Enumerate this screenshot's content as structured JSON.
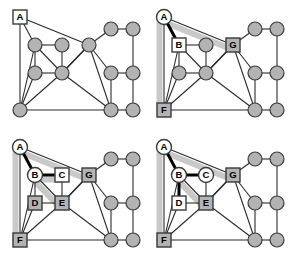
{
  "figure": {
    "panel_count": 4,
    "background_color": "#ffffff",
    "colors": {
      "node_fill_gray": "#b3b3b3",
      "node_fill_white": "#ffffff",
      "node_stroke": "#3a3a3a",
      "edge": "#2b2b2b",
      "edge_highlight_thick": "#000000",
      "path_halo": "#c9c9c9",
      "label_text": "#000000"
    },
    "geometry": {
      "view_width": 144,
      "view_height": 129,
      "node_radius": 7,
      "square_size": 14
    }
  },
  "graph": {
    "description": "Undirected graph with 13 vertices drawn in all four panels",
    "nodes": [
      {
        "id": "A",
        "x": 20,
        "y": 17
      },
      {
        "id": "B",
        "x": 35,
        "y": 45
      },
      {
        "id": "C",
        "x": 62,
        "y": 45
      },
      {
        "id": "G",
        "x": 89,
        "y": 45
      },
      {
        "id": "D",
        "x": 35,
        "y": 73
      },
      {
        "id": "E",
        "x": 62,
        "y": 73
      },
      {
        "id": "F",
        "x": 20,
        "y": 110
      },
      {
        "id": "H",
        "x": 111,
        "y": 29
      },
      {
        "id": "I",
        "x": 133,
        "y": 29
      },
      {
        "id": "J",
        "x": 111,
        "y": 73
      },
      {
        "id": "K",
        "x": 133,
        "y": 73
      },
      {
        "id": "L",
        "x": 111,
        "y": 110
      },
      {
        "id": "M",
        "x": 133,
        "y": 110
      }
    ],
    "edges": [
      [
        "A",
        "B"
      ],
      [
        "A",
        "F"
      ],
      [
        "A",
        "G"
      ],
      [
        "B",
        "C"
      ],
      [
        "B",
        "D"
      ],
      [
        "B",
        "E"
      ],
      [
        "B",
        "F"
      ],
      [
        "C",
        "E"
      ],
      [
        "D",
        "E"
      ],
      [
        "D",
        "F"
      ],
      [
        "E",
        "F"
      ],
      [
        "E",
        "G"
      ],
      [
        "E",
        "L"
      ],
      [
        "G",
        "H"
      ],
      [
        "G",
        "J"
      ],
      [
        "G",
        "L"
      ],
      [
        "G",
        "E"
      ],
      [
        "H",
        "I"
      ],
      [
        "I",
        "K"
      ],
      [
        "J",
        "K"
      ],
      [
        "J",
        "L"
      ],
      [
        "F",
        "L"
      ],
      [
        "L",
        "M"
      ],
      [
        "K",
        "M"
      ]
    ]
  },
  "panels": [
    {
      "index": 0,
      "name": "panel-initial-graph",
      "caption": "",
      "labeled_nodes": [
        {
          "id": "A",
          "label": "A",
          "shape": "square",
          "fill": "white"
        }
      ],
      "highlight_paths": [],
      "thick_edges": []
    },
    {
      "index": 1,
      "name": "panel-step-1",
      "caption": "",
      "labeled_nodes": [
        {
          "id": "A",
          "label": "A",
          "shape": "circle",
          "fill": "white"
        },
        {
          "id": "B",
          "label": "B",
          "shape": "square",
          "fill": "white"
        },
        {
          "id": "G",
          "label": "G",
          "shape": "square",
          "fill": "gray"
        },
        {
          "id": "F",
          "label": "F",
          "shape": "square",
          "fill": "gray"
        }
      ],
      "highlight_paths": [
        [
          "A",
          "G"
        ],
        [
          "A",
          "F"
        ]
      ],
      "thick_edges": [
        [
          "A",
          "B"
        ]
      ]
    },
    {
      "index": 2,
      "name": "panel-step-2",
      "caption": "",
      "labeled_nodes": [
        {
          "id": "A",
          "label": "A",
          "shape": "circle",
          "fill": "white"
        },
        {
          "id": "B",
          "label": "B",
          "shape": "circle",
          "fill": "white"
        },
        {
          "id": "C",
          "label": "C",
          "shape": "square",
          "fill": "white"
        },
        {
          "id": "G",
          "label": "G",
          "shape": "square",
          "fill": "gray"
        },
        {
          "id": "D",
          "label": "D",
          "shape": "square",
          "fill": "gray"
        },
        {
          "id": "E",
          "label": "E",
          "shape": "square",
          "fill": "gray"
        },
        {
          "id": "F",
          "label": "F",
          "shape": "square",
          "fill": "gray"
        }
      ],
      "highlight_paths": [
        [
          "A",
          "G"
        ],
        [
          "A",
          "F"
        ],
        [
          "B",
          "C"
        ],
        [
          "B",
          "E"
        ]
      ],
      "thick_edges": [
        [
          "A",
          "B"
        ],
        [
          "B",
          "C"
        ]
      ]
    },
    {
      "index": 3,
      "name": "panel-step-3",
      "caption": "",
      "labeled_nodes": [
        {
          "id": "A",
          "label": "A",
          "shape": "circle",
          "fill": "white"
        },
        {
          "id": "B",
          "label": "B",
          "shape": "circle",
          "fill": "white"
        },
        {
          "id": "C",
          "label": "C",
          "shape": "circle",
          "fill": "white"
        },
        {
          "id": "G",
          "label": "G",
          "shape": "square",
          "fill": "gray"
        },
        {
          "id": "D",
          "label": "D",
          "shape": "square",
          "fill": "white"
        },
        {
          "id": "E",
          "label": "E",
          "shape": "square",
          "fill": "gray"
        },
        {
          "id": "F",
          "label": "F",
          "shape": "square",
          "fill": "gray"
        }
      ],
      "highlight_paths": [
        [
          "A",
          "G"
        ],
        [
          "A",
          "F"
        ],
        [
          "B",
          "E"
        ]
      ],
      "thick_edges": [
        [
          "A",
          "B"
        ],
        [
          "B",
          "C"
        ],
        [
          "B",
          "D"
        ]
      ]
    }
  ]
}
